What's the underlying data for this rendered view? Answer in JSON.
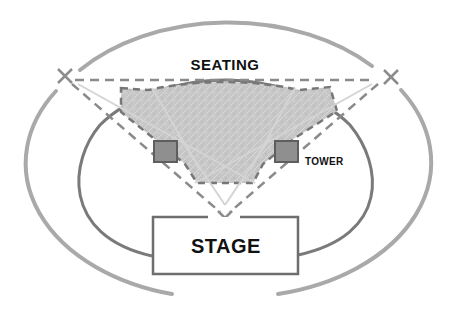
{
  "diagram": {
    "type": "venue-layout",
    "labels": {
      "seating": "SEATING",
      "tower": "TOWER",
      "stage": "STAGE"
    },
    "colors": {
      "outer_ring": "#a8a8a8",
      "inner_ring": "#777777",
      "dashed_lines": "#8a8a8a",
      "sight_lines": "#d2d2d2",
      "seating_fill": "#c4c4c4",
      "tower_fill": "#8c8c8c",
      "tower_stroke": "#5e5e5e",
      "stage_stroke": "#6e6e6e",
      "text": "#111111"
    },
    "elements": {
      "speaker_points": [
        "left-x-marker",
        "right-x-marker",
        "stage-x-marker"
      ],
      "towers": [
        "left-tower",
        "right-tower"
      ]
    }
  }
}
